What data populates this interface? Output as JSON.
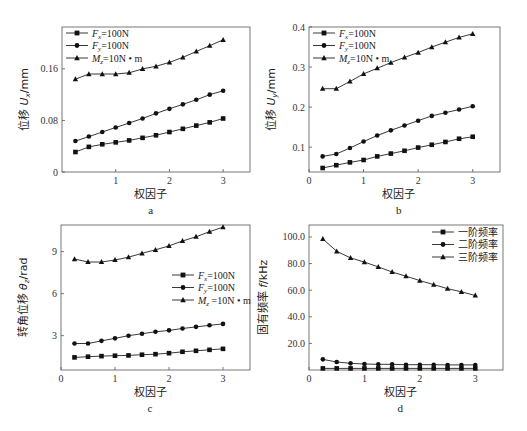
{
  "chart_data": [
    {
      "id": "a",
      "type": "line",
      "caption": "a",
      "xlabel": "权因子",
      "ylabel": "位移 U_x/mm",
      "ylabel_parts": [
        "位移 ",
        "U",
        "x",
        "/mm"
      ],
      "xlim": [
        0,
        3.5
      ],
      "ylim": [
        0,
        0.225
      ],
      "xticks": [
        1,
        2,
        3
      ],
      "xtick_labels": [
        "1",
        "2",
        "3"
      ],
      "yticks": [
        0,
        0.08,
        0.16
      ],
      "ytick_labels": [
        "0",
        "0.08",
        "0.16"
      ],
      "grid": false,
      "legend_position": "upper left",
      "frame": {
        "left": 62,
        "right": 250,
        "top": 27,
        "bottom": 172
      },
      "x": [
        0.25,
        0.5,
        0.75,
        1.0,
        1.25,
        1.5,
        1.75,
        2.0,
        2.25,
        2.5,
        2.75,
        3.0
      ],
      "series": [
        {
          "name": "Fx=100N",
          "label_main": "F",
          "label_sub": "x",
          "label_rest": "=100N",
          "marker": "square",
          "values": [
            0.031,
            0.039,
            0.043,
            0.046,
            0.049,
            0.053,
            0.057,
            0.062,
            0.067,
            0.072,
            0.077,
            0.083
          ]
        },
        {
          "name": "Fy=100N",
          "label_main": "F",
          "label_sub": "y",
          "label_rest": "=100N",
          "marker": "circle",
          "values": [
            0.048,
            0.055,
            0.062,
            0.069,
            0.076,
            0.083,
            0.091,
            0.098,
            0.105,
            0.112,
            0.12,
            0.126
          ]
        },
        {
          "name": "Mz=10N·m",
          "label_main": "M",
          "label_sub": "z",
          "label_rest": "=10N • m",
          "marker": "triangle",
          "values": [
            0.144,
            0.152,
            0.152,
            0.152,
            0.154,
            0.16,
            0.164,
            0.17,
            0.178,
            0.187,
            0.196,
            0.205
          ]
        }
      ]
    },
    {
      "id": "b",
      "type": "line",
      "caption": "b",
      "xlabel": "权因子",
      "ylabel": "位移 U_y/mm",
      "ylabel_parts": [
        "位移 ",
        "U",
        "y",
        "/mm"
      ],
      "xlim": [
        0,
        3.5
      ],
      "ylim": [
        0.038,
        0.4
      ],
      "xticks": [
        0,
        1,
        2,
        3
      ],
      "xtick_labels": [
        "0",
        "1",
        "2",
        "3"
      ],
      "yticks": [
        0.1,
        0.2,
        0.3,
        0.4
      ],
      "ytick_labels": [
        "0.1",
        "0.2",
        "0.3",
        "0.4"
      ],
      "grid": false,
      "legend_position": "upper left",
      "frame": {
        "left": 309,
        "right": 500,
        "top": 27,
        "bottom": 172
      },
      "x": [
        0.25,
        0.5,
        0.75,
        1.0,
        1.25,
        1.5,
        1.75,
        2.0,
        2.25,
        2.5,
        2.75,
        3.0
      ],
      "series": [
        {
          "name": "Fx=100N",
          "label_main": "F",
          "label_sub": "x",
          "label_rest": "=100N",
          "marker": "square",
          "values": [
            0.048,
            0.055,
            0.062,
            0.068,
            0.077,
            0.084,
            0.091,
            0.099,
            0.106,
            0.113,
            0.121,
            0.126
          ]
        },
        {
          "name": "Fy=100N",
          "label_main": "F",
          "label_sub": "y",
          "label_rest": "=100N",
          "marker": "circle",
          "values": [
            0.077,
            0.083,
            0.098,
            0.114,
            0.129,
            0.142,
            0.154,
            0.166,
            0.178,
            0.186,
            0.194,
            0.202
          ]
        },
        {
          "name": "Mz=10N·m",
          "label_main": "M",
          "label_sub": "z",
          "label_rest": "=10N • m",
          "marker": "triangle",
          "values": [
            0.246,
            0.246,
            0.264,
            0.283,
            0.297,
            0.311,
            0.324,
            0.336,
            0.35,
            0.362,
            0.374,
            0.383
          ]
        }
      ]
    },
    {
      "id": "c",
      "type": "line",
      "caption": "c",
      "xlabel": "权因子",
      "ylabel": "转角位移 θ_z/rad",
      "ylabel_parts": [
        "转角位移 ",
        "θ",
        "z",
        "/rad"
      ],
      "xlim": [
        0,
        3.5
      ],
      "ylim": [
        0.55,
        10.9
      ],
      "xticks": [
        0,
        1,
        2,
        3
      ],
      "xtick_labels": [
        "0",
        "1",
        "2",
        "3"
      ],
      "yticks": [
        3,
        6,
        9
      ],
      "ytick_labels": [
        "3",
        "6",
        "9"
      ],
      "grid": false,
      "legend_position": "center right",
      "frame": {
        "left": 61,
        "right": 250,
        "top": 225,
        "bottom": 370
      },
      "x": [
        0.25,
        0.5,
        0.75,
        1.0,
        1.25,
        1.5,
        1.75,
        2.0,
        2.25,
        2.5,
        2.75,
        3.0
      ],
      "series": [
        {
          "name": "Fx=100N",
          "label_main": "F",
          "label_sub": "x",
          "label_rest": "=100N",
          "marker": "square",
          "values": [
            1.45,
            1.5,
            1.54,
            1.57,
            1.59,
            1.64,
            1.68,
            1.75,
            1.85,
            1.92,
            1.99,
            2.06
          ]
        },
        {
          "name": "Fy=100N",
          "label_main": "F",
          "label_sub": "y",
          "label_rest": "=100N",
          "marker": "circle",
          "values": [
            2.44,
            2.44,
            2.63,
            2.81,
            3.0,
            3.14,
            3.28,
            3.38,
            3.51,
            3.63,
            3.74,
            3.84
          ]
        },
        {
          "name": "Mz=10N·m",
          "label_main": "M",
          "label_sub": "z",
          "label_rest": " =10N • m",
          "marker": "triangle",
          "values": [
            8.47,
            8.26,
            8.26,
            8.4,
            8.6,
            8.88,
            9.13,
            9.41,
            9.76,
            10.06,
            10.42,
            10.75
          ]
        }
      ]
    },
    {
      "id": "d",
      "type": "line",
      "caption": "d",
      "xlabel": "权因子",
      "ylabel": "固有频率 f/kHz",
      "ylabel_parts": [
        "固有频率 ",
        "f",
        "",
        "/kHz"
      ],
      "xlim": [
        0,
        3.5
      ],
      "ylim": [
        0,
        109
      ],
      "xticks": [
        0,
        1,
        2,
        3
      ],
      "xtick_labels": [
        "0",
        "1",
        "2",
        "3"
      ],
      "yticks": [
        20,
        40,
        60,
        80,
        100
      ],
      "ytick_labels": [
        "20.0",
        "40.0",
        "60.0",
        "80.0",
        "100.0"
      ],
      "grid": false,
      "legend_position": "upper right",
      "frame": {
        "left": 309,
        "right": 503,
        "top": 225,
        "bottom": 370
      },
      "x": [
        0.25,
        0.5,
        0.75,
        1.0,
        1.25,
        1.5,
        1.75,
        2.0,
        2.25,
        2.5,
        2.75,
        3.0
      ],
      "series": [
        {
          "name": "一阶频率",
          "label_main": "一阶频率",
          "label_sub": "",
          "label_rest": "",
          "marker": "square",
          "values": [
            1.2,
            1.2,
            1.2,
            1.2,
            1.2,
            1.2,
            1.2,
            1.2,
            1.2,
            1.2,
            1.2,
            1.2
          ]
        },
        {
          "name": "二阶频率",
          "label_main": "二阶频率",
          "label_sub": "",
          "label_rest": "",
          "marker": "circle",
          "values": [
            8.0,
            6.0,
            5.0,
            4.5,
            4.3,
            4.3,
            4.0,
            4.0,
            4.0,
            3.8,
            3.8,
            3.8
          ]
        },
        {
          "name": "三阶频率",
          "label_main": "三阶频率",
          "label_sub": "",
          "label_rest": "",
          "marker": "triangle",
          "values": [
            98.5,
            89.2,
            84.3,
            81.1,
            77.5,
            73.7,
            70.5,
            67.2,
            64.2,
            61.1,
            58.8,
            56.0
          ]
        }
      ]
    }
  ],
  "layout": {
    "legend_origin": {
      "a": {
        "x": 66,
        "y": 33
      },
      "b": {
        "x": 313,
        "y": 33
      },
      "c": {
        "x": 172,
        "y": 275
      },
      "d": {
        "x": 432,
        "y": 232
      }
    }
  }
}
